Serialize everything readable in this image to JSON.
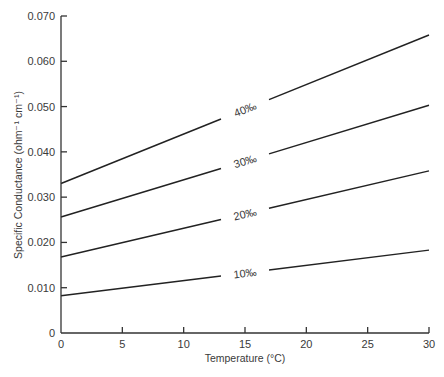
{
  "chart_data": {
    "type": "line",
    "title": "",
    "xlabel": "Temperature (°C)",
    "ylabel": "Specific Conductance (ohm⁻¹ cm⁻¹)",
    "xlim": [
      0,
      30
    ],
    "ylim": [
      0,
      0.07
    ],
    "grid": false,
    "legend_position": "inline labels on lines",
    "x_ticks": [
      0,
      5,
      10,
      15,
      20,
      25,
      30
    ],
    "x_tick_labels": [
      "0",
      "5",
      "10",
      "15",
      "20",
      "25",
      "30"
    ],
    "y_ticks": [
      0,
      0.01,
      0.02,
      0.03,
      0.04,
      0.05,
      0.06,
      0.07
    ],
    "y_tick_labels": [
      "0",
      "0.010",
      "0.020",
      "0.030",
      "0.040",
      "0.050",
      "0.060",
      "0.070"
    ],
    "x": [
      0,
      30
    ],
    "series": [
      {
        "name": "10‰",
        "values": [
          0.0082,
          0.0183
        ],
        "label_at_x": 15
      },
      {
        "name": "20‰",
        "values": [
          0.0168,
          0.0358
        ],
        "label_at_x": 15
      },
      {
        "name": "30‰",
        "values": [
          0.0256,
          0.0503
        ],
        "label_at_x": 15
      },
      {
        "name": "40‰",
        "values": [
          0.033,
          0.0658
        ],
        "label_at_x": 15
      }
    ]
  }
}
